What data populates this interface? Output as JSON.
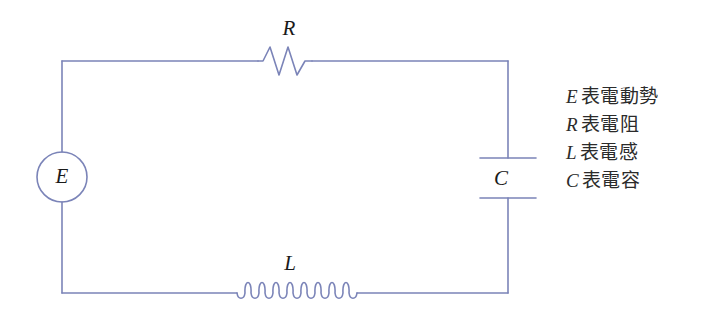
{
  "diagram": {
    "wire_color": "#7b84b8",
    "label_color": "#1a1a1a",
    "background": "#ffffff"
  },
  "components": {
    "source": {
      "label": "E",
      "shape": "circle",
      "cx": 62,
      "cy": 177,
      "r": 25
    },
    "resistor": {
      "label": "R",
      "shape": "zigzag",
      "peaks": 3,
      "x_start": 258,
      "x_end": 312,
      "y": 61
    },
    "inductor": {
      "label": "L",
      "shape": "coil",
      "loops": 8,
      "x_start": 237,
      "x_end": 357,
      "y": 293
    },
    "capacitor": {
      "label": "C",
      "shape": "parallel-plates",
      "x": 508,
      "plate_top_y": 158,
      "plate_bottom_y": 198,
      "plate_width": 56
    }
  },
  "loop": {
    "left": 62,
    "right": 508,
    "top": 61,
    "bottom": 293
  },
  "legend": {
    "items": [
      {
        "symbol": "E",
        "text": "表電動勢"
      },
      {
        "symbol": "R",
        "text": "表電阻"
      },
      {
        "symbol": "L",
        "text": "表電感"
      },
      {
        "symbol": "C",
        "text": "表電容"
      }
    ]
  }
}
